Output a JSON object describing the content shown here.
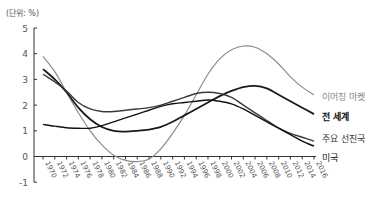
{
  "chart_data": {
    "type": "line",
    "title": "",
    "unit_label": "(단위: %)",
    "xlabel": "",
    "ylabel": "",
    "ylim": [
      -1,
      5
    ],
    "yticks": [
      5,
      4,
      3,
      2,
      1,
      0,
      -1
    ],
    "grid": false,
    "legend_position": "inline-right",
    "x": [
      1970,
      1972,
      1974,
      1976,
      1978,
      1980,
      1982,
      1984,
      1986,
      1988,
      1990,
      1992,
      1994,
      1996,
      1998,
      2000,
      2002,
      2004,
      2006,
      2008,
      2010,
      2012,
      2014,
      2016
    ],
    "series": [
      {
        "name": "이머징 마켓",
        "color": "#8c8c8c",
        "values": [
          3.9,
          3.3,
          2.5,
          1.7,
          1.0,
          0.45,
          0.05,
          -0.15,
          -0.2,
          -0.1,
          0.3,
          0.9,
          1.6,
          2.4,
          3.2,
          3.8,
          4.15,
          4.3,
          4.25,
          4.0,
          3.6,
          3.1,
          2.7,
          2.4
        ]
      },
      {
        "name": "전 세계",
        "color": "#1a1a1a",
        "values": [
          3.4,
          3.0,
          2.5,
          1.9,
          1.45,
          1.15,
          1.0,
          0.97,
          1.0,
          1.05,
          1.15,
          1.35,
          1.6,
          1.85,
          2.1,
          2.35,
          2.55,
          2.7,
          2.75,
          2.65,
          2.4,
          2.15,
          1.9,
          1.65
        ]
      },
      {
        "name": "주요 선진국",
        "color": "#3a3a3a",
        "values": [
          3.2,
          2.9,
          2.55,
          2.1,
          1.85,
          1.75,
          1.75,
          1.8,
          1.85,
          1.9,
          2.0,
          2.15,
          2.3,
          2.45,
          2.5,
          2.45,
          2.3,
          2.0,
          1.7,
          1.4,
          1.1,
          0.9,
          0.75,
          0.6
        ]
      },
      {
        "name": "미국",
        "color": "#111111",
        "values": [
          1.25,
          1.18,
          1.12,
          1.1,
          1.1,
          1.2,
          1.35,
          1.5,
          1.65,
          1.8,
          1.95,
          2.05,
          2.1,
          2.15,
          2.2,
          2.15,
          2.05,
          1.85,
          1.6,
          1.35,
          1.1,
          0.85,
          0.6,
          0.4
        ]
      }
    ]
  },
  "labels": {
    "unit": "(단위: %)",
    "emerging": "이머징 마켓",
    "world": "전 세계",
    "developed": "주요 선진국",
    "us": "미국"
  }
}
